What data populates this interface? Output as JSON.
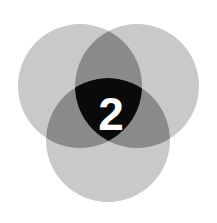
{
  "figure": {
    "kind": "venn-diagram",
    "title": "",
    "width": 217,
    "height": 223,
    "background_color": "#ffffff"
  },
  "chart_data": {
    "type": "table",
    "title": "",
    "xlabel": "",
    "ylabel": "",
    "diagram_type": "three-set-venn",
    "sets": [
      {
        "id": "top-left",
        "label": "",
        "center_x": 80,
        "center_y": 86,
        "radius": 62,
        "fill": "#c9c9c9"
      },
      {
        "id": "top-right",
        "label": "",
        "center_x": 137,
        "center_y": 86,
        "radius": 62,
        "fill": "#c9c9c9"
      },
      {
        "id": "bottom",
        "label": "",
        "center_x": 108,
        "center_y": 140,
        "radius": 62,
        "fill": "#c9c9c9"
      }
    ],
    "regions": [
      {
        "id": "single",
        "overlap_count": 1,
        "fill": "#c9c9c9",
        "value_label": ""
      },
      {
        "id": "pairwise",
        "overlap_count": 2,
        "fill": "#8a8a8a",
        "value_label": ""
      },
      {
        "id": "triple-center",
        "overlap_count": 3,
        "fill": "#0a0a0a",
        "value_label": "2"
      }
    ],
    "categories": [
      "single",
      "pairwise",
      "triple-center"
    ],
    "values": [
      0,
      0,
      2
    ],
    "legend_position": "none",
    "grid": false
  },
  "center": {
    "value": "2",
    "text_color": "#ffffff",
    "fill_color": "#0a0a0a"
  },
  "colors": {
    "background": "#ffffff",
    "circle_fill": "#c9c9c9",
    "pair_overlap": "#8a8a8a",
    "triple_overlap": "#0a0a0a",
    "center_text": "#ffffff"
  }
}
